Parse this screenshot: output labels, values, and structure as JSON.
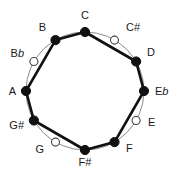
{
  "diagram": {
    "type": "pitch-class-circle",
    "center": {
      "x": 85,
      "y": 91
    },
    "radius": 59,
    "background_color": "#ffffff",
    "filled_node_color": "#111111",
    "open_node_fill": "#ffffff",
    "open_node_stroke": "#444444",
    "thick_edge_color": "#111111",
    "thin_arc_color": "#8a8a8a",
    "nodes": [
      {
        "id": "C",
        "label_letter": "C",
        "label_accidental": "",
        "accidental_type": "none",
        "clock_position": 0,
        "angle_deg": 0,
        "filled": true,
        "x": 85,
        "y": 32,
        "label_x": 85,
        "label_y": 19,
        "label_anchor": "middle"
      },
      {
        "id": "C#",
        "label_letter": "C",
        "label_accidental": "#",
        "accidental_type": "sharp",
        "clock_position": 1,
        "angle_deg": 30,
        "filled": false,
        "x": 114.5,
        "y": 40.1,
        "label_x": 126,
        "label_y": 31,
        "label_anchor": "start"
      },
      {
        "id": "D",
        "label_letter": "D",
        "label_accidental": "",
        "accidental_type": "none",
        "clock_position": 2,
        "angle_deg": 60,
        "filled": true,
        "x": 136.1,
        "y": 61.5,
        "label_x": 147,
        "label_y": 56,
        "label_anchor": "start"
      },
      {
        "id": "Eb",
        "label_letter": "E",
        "label_accidental": "b",
        "accidental_type": "flat",
        "clock_position": 3,
        "angle_deg": 90,
        "filled": true,
        "x": 144,
        "y": 91,
        "label_x": 155,
        "label_y": 95,
        "label_anchor": "start"
      },
      {
        "id": "E",
        "label_letter": "E",
        "label_accidental": "",
        "accidental_type": "none",
        "clock_position": 4,
        "angle_deg": 120,
        "filled": false,
        "x": 136.1,
        "y": 120.5,
        "label_x": 148,
        "label_y": 126,
        "label_anchor": "start"
      },
      {
        "id": "F",
        "label_letter": "F",
        "label_accidental": "",
        "accidental_type": "none",
        "clock_position": 5,
        "angle_deg": 150,
        "filled": true,
        "x": 114.5,
        "y": 142.1,
        "label_x": 126,
        "label_y": 152,
        "label_anchor": "start"
      },
      {
        "id": "F#",
        "label_letter": "F",
        "label_accidental": "#",
        "accidental_type": "sharp",
        "clock_position": 6,
        "angle_deg": 180,
        "filled": true,
        "x": 85,
        "y": 150,
        "label_x": 85,
        "label_y": 166,
        "label_anchor": "middle"
      },
      {
        "id": "G",
        "label_letter": "G",
        "label_accidental": "",
        "accidental_type": "none",
        "clock_position": 7,
        "angle_deg": 210,
        "filled": false,
        "x": 55.5,
        "y": 142.1,
        "label_x": 44,
        "label_y": 153,
        "label_anchor": "end"
      },
      {
        "id": "G#",
        "label_letter": "G",
        "label_accidental": "#",
        "accidental_type": "sharp",
        "clock_position": 8,
        "angle_deg": 240,
        "filled": true,
        "x": 33.9,
        "y": 120.5,
        "label_x": 24,
        "label_y": 129,
        "label_anchor": "end"
      },
      {
        "id": "A",
        "label_letter": "A",
        "label_accidental": "",
        "accidental_type": "none",
        "clock_position": 9,
        "angle_deg": 270,
        "filled": true,
        "x": 26,
        "y": 91,
        "label_x": 16,
        "label_y": 95,
        "label_anchor": "end"
      },
      {
        "id": "Bb",
        "label_letter": "B",
        "label_accidental": "b",
        "accidental_type": "flat",
        "clock_position": 10,
        "angle_deg": 300,
        "filled": false,
        "x": 33.9,
        "y": 61.5,
        "label_x": 24,
        "label_y": 57,
        "label_anchor": "end"
      },
      {
        "id": "B",
        "label_letter": "B",
        "label_accidental": "",
        "accidental_type": "none",
        "clock_position": 11,
        "angle_deg": 330,
        "filled": true,
        "x": 55.5,
        "y": 40.1,
        "label_x": 46,
        "label_y": 31,
        "label_anchor": "end"
      }
    ],
    "thick_edges": [
      [
        "B",
        "C"
      ],
      [
        "C",
        "D"
      ],
      [
        "D",
        "Eb"
      ],
      [
        "Eb",
        "F"
      ],
      [
        "F",
        "F#"
      ],
      [
        "F#",
        "G#"
      ],
      [
        "G#",
        "A"
      ],
      [
        "A",
        "B"
      ]
    ]
  }
}
